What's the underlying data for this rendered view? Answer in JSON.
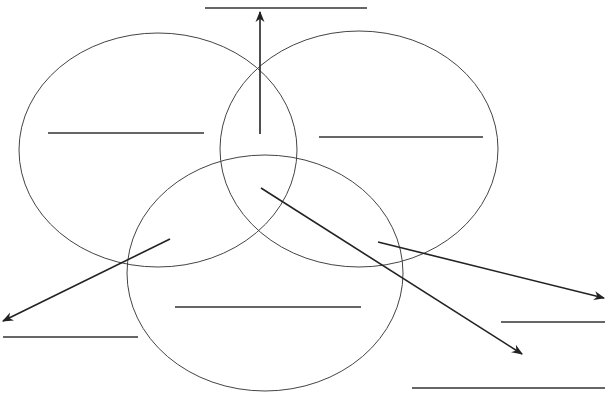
{
  "diagram": {
    "type": "three-set venn diagram worksheet",
    "sets": [
      {
        "id": "set-a",
        "position": "top-left",
        "label": ""
      },
      {
        "id": "set-b",
        "position": "top-right",
        "label": ""
      },
      {
        "id": "set-c",
        "position": "bottom",
        "label": ""
      }
    ],
    "answer_blanks": [
      {
        "id": "blank-set-a",
        "region": "only set A",
        "value": ""
      },
      {
        "id": "blank-set-b",
        "region": "only set B",
        "value": ""
      },
      {
        "id": "blank-set-c",
        "region": "only set C",
        "value": ""
      },
      {
        "id": "blank-ab",
        "region": "A and B",
        "value": ""
      },
      {
        "id": "blank-ac",
        "region": "A and C",
        "value": ""
      },
      {
        "id": "blank-bc",
        "region": "B and C",
        "value": ""
      },
      {
        "id": "blank-abc",
        "region": "A, B and C",
        "value": ""
      }
    ],
    "colors": {
      "stroke": "#333333",
      "background": "#ffffff"
    }
  }
}
